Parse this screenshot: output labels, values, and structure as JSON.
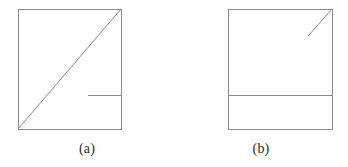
{
  "figure": {
    "type": "line-diagram",
    "background_color": "#ffffff",
    "width": 348,
    "height": 167,
    "stroke_color": "#8a8a8a",
    "caption_color": "#2b2b2b"
  },
  "panels": [
    {
      "id": "a",
      "caption": "(a)",
      "square": {
        "x": 18,
        "y": 9,
        "width": 103,
        "height": 120,
        "stroke_color": "#8a8a8a",
        "stroke_width": 1,
        "fill": "none"
      },
      "segments": [
        {
          "name": "main-diagonal",
          "description": "diagonal from bottom-left corner to top-right corner",
          "x1": 18,
          "y1": 129,
          "x2": 121,
          "y2": 9,
          "stroke_color": "#8a8a8a",
          "stroke_width": 1
        },
        {
          "name": "horizontal-stub",
          "description": "short horizontal segment meeting the right edge",
          "x1": 88,
          "y1": 95,
          "x2": 121,
          "y2": 95,
          "stroke_color": "#8a8a8a",
          "stroke_width": 1
        }
      ]
    },
    {
      "id": "b",
      "caption": "(b)",
      "square": {
        "x": 54,
        "y": 9,
        "width": 104,
        "height": 120,
        "stroke_color": "#8a8a8a",
        "stroke_width": 1,
        "fill": "none"
      },
      "segments": [
        {
          "name": "corner-diagonal",
          "description": "short diagonal from top-right corner toward the interior",
          "x1": 158,
          "y1": 9,
          "x2": 134,
          "y2": 36,
          "stroke_color": "#8a8a8a",
          "stroke_width": 1
        },
        {
          "name": "full-horizontal",
          "description": "horizontal line spanning the full square width",
          "x1": 54,
          "y1": 95,
          "x2": 158,
          "y2": 95,
          "stroke_color": "#8a8a8a",
          "stroke_width": 1
        }
      ]
    }
  ]
}
